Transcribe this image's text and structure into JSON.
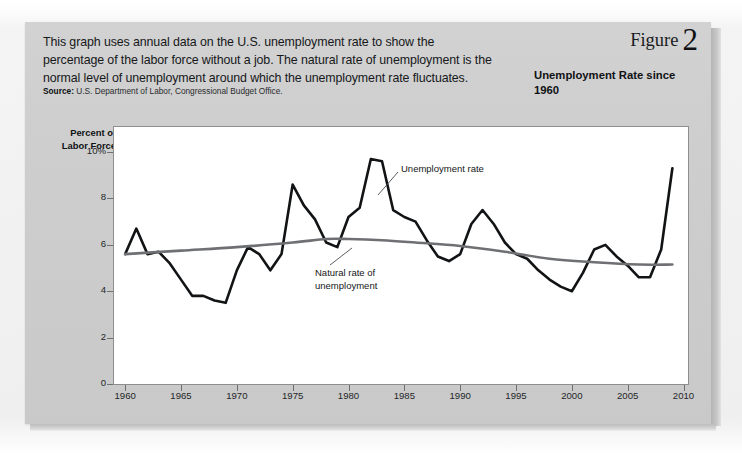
{
  "caption": {
    "text": "This graph uses annual data on the U.S. unemployment rate to show the percentage of the labor force without a job. The natural rate of unemployment is the normal level of unemployment around which the unemployment rate fluctuates.",
    "source_label": "Source:",
    "source_text": " U.S. Department of Labor, Congressional Budget Office."
  },
  "figure": {
    "word": "Figure",
    "number": "2",
    "title": "Unemployment Rate since 1960"
  },
  "chart_data": {
    "type": "line",
    "title": "Unemployment Rate since 1960",
    "xlabel": "",
    "ylabel": "Percent of Labor Force",
    "xlim": [
      1959,
      2010
    ],
    "ylim": [
      0,
      11
    ],
    "grid": false,
    "legend": "annotations",
    "yticks": [
      "0",
      "2",
      "4",
      "6",
      "8",
      "10%"
    ],
    "ytick_values": [
      0,
      2,
      4,
      6,
      8,
      10
    ],
    "xticks": [
      "1960",
      "1965",
      "1970",
      "1975",
      "1980",
      "1985",
      "1990",
      "1995",
      "2000",
      "2005",
      "2010"
    ],
    "xtick_values": [
      1960,
      1965,
      1970,
      1975,
      1980,
      1985,
      1990,
      1995,
      2000,
      2005,
      2010
    ],
    "annotations": [
      {
        "name": "unemployment-rate",
        "text": "Unemployment rate",
        "x": 1983.5,
        "y": 9.6
      },
      {
        "name": "natural-rate",
        "text": "Natural rate of unemployment",
        "x": 1978,
        "y": 4.4
      }
    ],
    "series": [
      {
        "name": "Unemployment rate",
        "color": "#111315",
        "width": 2.6,
        "x": [
          1960,
          1961,
          1962,
          1963,
          1964,
          1965,
          1966,
          1967,
          1968,
          1969,
          1970,
          1971,
          1972,
          1973,
          1974,
          1975,
          1976,
          1977,
          1978,
          1979,
          1980,
          1981,
          1982,
          1983,
          1984,
          1985,
          1986,
          1987,
          1988,
          1989,
          1990,
          1991,
          1992,
          1993,
          1994,
          1995,
          1996,
          1997,
          1998,
          1999,
          2000,
          2001,
          2002,
          2003,
          2004,
          2005,
          2006,
          2007,
          2008,
          2009
        ],
        "values": [
          5.6,
          6.7,
          5.6,
          5.7,
          5.2,
          4.5,
          3.8,
          3.8,
          3.6,
          3.5,
          4.9,
          5.9,
          5.6,
          4.9,
          5.6,
          8.6,
          7.7,
          7.1,
          6.1,
          5.9,
          7.2,
          7.6,
          9.7,
          9.6,
          7.5,
          7.2,
          7.0,
          6.2,
          5.5,
          5.3,
          5.6,
          6.9,
          7.5,
          6.9,
          6.1,
          5.6,
          5.4,
          4.9,
          4.5,
          4.2,
          4.0,
          4.8,
          5.8,
          6.0,
          5.5,
          5.1,
          4.6,
          4.6,
          5.8,
          9.3
        ]
      },
      {
        "name": "Natural rate of unemployment",
        "color": "#6e7073",
        "width": 2.6,
        "x": [
          1960,
          1965,
          1970,
          1975,
          1978,
          1980,
          1983,
          1986,
          1990,
          1994,
          1998,
          2002,
          2006,
          2009
        ],
        "values": [
          5.6,
          5.75,
          5.9,
          6.1,
          6.25,
          6.25,
          6.2,
          6.1,
          5.95,
          5.7,
          5.4,
          5.25,
          5.15,
          5.15
        ]
      }
    ]
  }
}
